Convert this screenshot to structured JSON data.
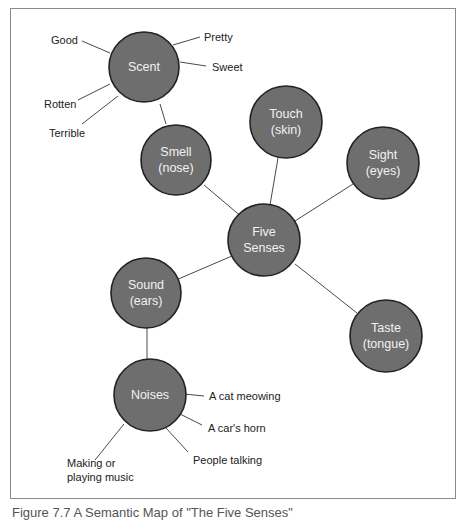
{
  "diagram": {
    "type": "semantic-map",
    "center": {
      "id": "five_senses",
      "label_line1": "Five",
      "label_line2": "Senses"
    },
    "nodes": {
      "scent": {
        "label_line1": "Scent"
      },
      "smell": {
        "label_line1": "Smell",
        "label_line2": "(nose)"
      },
      "touch": {
        "label_line1": "Touch",
        "label_line2": "(skin)"
      },
      "sight": {
        "label_line1": "Sight",
        "label_line2": "(eyes)"
      },
      "sound": {
        "label_line1": "Sound",
        "label_line2": "(ears)"
      },
      "taste": {
        "label_line1": "Taste",
        "label_line2": "(tongue)"
      },
      "noises": {
        "label_line1": "Noises"
      }
    },
    "scent_leaves": {
      "good": "Good",
      "pretty": "Pretty",
      "sweet": "Sweet",
      "rotten": "Rotten",
      "terrible": "Terrible"
    },
    "noises_leaves": {
      "cat": "A cat meowing",
      "horn": "A car's horn",
      "talking": "People talking",
      "music_line1": "Making or",
      "music_line2": "playing music"
    },
    "edges": [
      [
        "five_senses",
        "smell"
      ],
      [
        "five_senses",
        "touch"
      ],
      [
        "five_senses",
        "sight"
      ],
      [
        "five_senses",
        "sound"
      ],
      [
        "five_senses",
        "taste"
      ],
      [
        "smell",
        "scent"
      ],
      [
        "sound",
        "noises"
      ]
    ],
    "colors": {
      "node_fill": "#6e6e6e",
      "node_stroke": "#222222",
      "node_text": "#f2f2f2",
      "frame": "#8a8a8a"
    }
  },
  "caption": "Figure 7.7 A Semantic Map of \"The Five Senses\""
}
